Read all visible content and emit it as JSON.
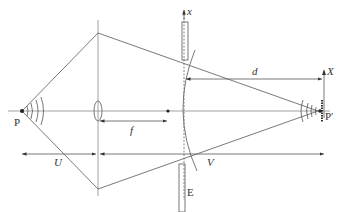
{
  "diagram": {
    "title": "",
    "labels": {
      "source_point": "P",
      "image_point": "P′",
      "object_distance": "U",
      "image_distance": "V",
      "focal_length": "f",
      "distance_d": "d",
      "screen_axis_x": "x",
      "image_axis_X": "X",
      "plate_E": "E"
    },
    "elements": [
      "point source P emitting spherical waves",
      "converging lens on optical axis",
      "focal point",
      "curved wavefront near screen",
      "slit/plate with x axis",
      "plate E",
      "image point P′ with converging waves",
      "axis X at image plane"
    ]
  }
}
